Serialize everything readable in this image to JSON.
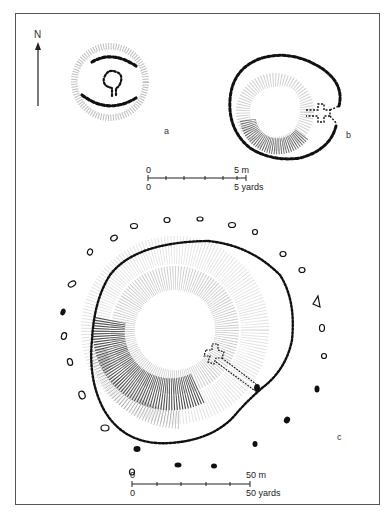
{
  "figure": {
    "north_label": "N",
    "plans": [
      {
        "id": "a",
        "label": "a",
        "description": "small hut circle with dotted inner ring and keyhole-shaped hearth"
      },
      {
        "id": "b",
        "label": "b",
        "description": "oval enclosure with hatched mound and cross-shaped entrance"
      },
      {
        "id": "c",
        "label": "c",
        "description": "large circular enclosure ringed by outer posts/stones, with central mound and cross-shaped feature"
      }
    ],
    "scale_small": {
      "top_zero": "0",
      "top_end": "5 m",
      "bottom_zero": "0",
      "bottom_end": "5 yards"
    },
    "scale_large": {
      "top_zero": "0",
      "top_end": "50 m",
      "bottom_zero": "0",
      "bottom_end": "50 yards"
    },
    "colors": {
      "ink": "#1a1a1a",
      "hatch": "#444444",
      "frame": "#555555",
      "background": "#ffffff"
    }
  }
}
